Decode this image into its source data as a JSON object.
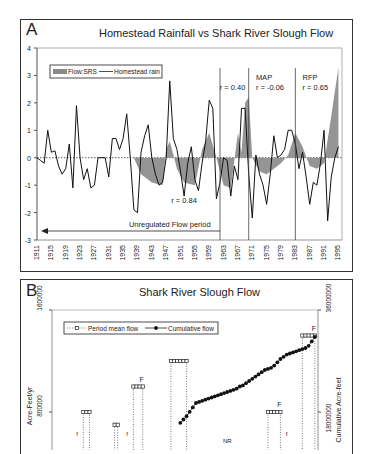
{
  "panelA": {
    "label": "A",
    "title": "Homestead Rainfall vs Shark River Slough Flow",
    "legend": {
      "flow": "Flow:SRS",
      "rain": "Homestead rain"
    },
    "annotations": {
      "r_unregulated": "r = 0.84",
      "r_period2": "r = 0.40",
      "map_label": "MAP",
      "r_map": "r = -0.06",
      "rfp_label": "RFP",
      "r_rfp": "r = 0.65",
      "unregulated": "Unregulated Flow period"
    }
  },
  "panelB": {
    "label": "B",
    "title": "Shark River Slough Flow",
    "legend": {
      "period": "Period mean flow",
      "cumulative": "Cumulative flow"
    },
    "y_left_label": "Acre-Feet/yr",
    "y_right_label": "Cumulative  Acre-feet",
    "y_left_ticks": [
      "1600000",
      "800000"
    ],
    "y_right_ticks": [
      "36000000",
      "18000000"
    ],
    "markers": [
      "F",
      "F",
      "F",
      "f",
      "f",
      "f",
      "NR"
    ]
  },
  "chart_data": [
    {
      "type": "line",
      "title": "Homestead Rainfall vs Shark River Slough Flow",
      "xlabel": "",
      "ylabel": "",
      "ylim": [
        -3,
        4
      ],
      "yticks": [
        -3,
        -2,
        -1,
        0,
        1,
        2,
        3,
        4
      ],
      "xticks": [
        "1911",
        "1915",
        "1919",
        "1923",
        "1927",
        "1931",
        "1935",
        "1939",
        "1943",
        "1947",
        "1951",
        "1955",
        "1959",
        "1963",
        "1967",
        "1971",
        "1975",
        "1979",
        "1983",
        "1987",
        "1991",
        "1995"
      ],
      "legend_position": "top-left",
      "series": [
        {
          "name": "Homestead rain",
          "style": "line",
          "x": [
            1911,
            1912,
            1913,
            1914,
            1915,
            1916,
            1917,
            1918,
            1919,
            1920,
            1921,
            1922,
            1923,
            1924,
            1925,
            1926,
            1927,
            1928,
            1929,
            1930,
            1931,
            1932,
            1933,
            1934,
            1935,
            1936,
            1937,
            1938,
            1939,
            1940,
            1941,
            1942,
            1943,
            1944,
            1945,
            1946,
            1947,
            1948,
            1949,
            1950,
            1951,
            1952,
            1953,
            1954,
            1955,
            1956,
            1957,
            1958,
            1959,
            1960,
            1961,
            1962,
            1963,
            1964,
            1965,
            1966,
            1967,
            1968,
            1969,
            1970,
            1971,
            1972,
            1973,
            1974,
            1975,
            1976,
            1977,
            1978,
            1979,
            1980,
            1981,
            1982,
            1983,
            1984,
            1985,
            1986,
            1987,
            1988,
            1989,
            1990,
            1991,
            1992,
            1993,
            1994,
            1995
          ],
          "values": [
            0,
            -0.1,
            -0.2,
            1.0,
            0.2,
            0.25,
            -0.3,
            -0.6,
            -0.4,
            0.5,
            -1.1,
            1.9,
            0.0,
            -0.8,
            -0.4,
            -1.1,
            -1.0,
            0.0,
            0.0,
            0.0,
            -0.7,
            0.7,
            0.7,
            0.3,
            0.7,
            1.6,
            0.0,
            -1.9,
            -2.0,
            0.2,
            0.8,
            1.2,
            0.0,
            -0.6,
            -1.0,
            -0.9,
            0.0,
            2.8,
            0.7,
            0.3,
            -0.5,
            -1.4,
            -0.2,
            0.4,
            -0.8,
            -1.2,
            -0.2,
            0.6,
            2.1,
            1.8,
            -1.5,
            -0.9,
            0.0,
            -0.1,
            -1.4,
            -0.3,
            -0.8,
            1.8,
            1.8,
            -0.6,
            -2.2,
            0.1,
            -0.6,
            -1.0,
            -1.7,
            -0.6,
            0.8,
            0.0,
            0.1,
            0.3,
            1.0,
            1.0,
            0.5,
            -0.4,
            0.2,
            -0.7,
            -1.7,
            -0.9,
            -1.0,
            -0.2,
            1.0,
            -2.3,
            -0.7,
            0.0,
            0.4
          ]
        },
        {
          "name": "Flow:SRS",
          "style": "area",
          "x": [
            1911,
            1935,
            1938,
            1940,
            1943,
            1946,
            1947,
            1948,
            1950,
            1952,
            1955,
            1957,
            1959,
            1961,
            1963,
            1965,
            1967,
            1968,
            1969,
            1970,
            1971,
            1973,
            1975,
            1977,
            1979,
            1981,
            1983,
            1985,
            1987,
            1989,
            1991,
            1993,
            1995
          ],
          "values": [
            0,
            0,
            0,
            -0.6,
            -0.9,
            -1.0,
            0.3,
            0.6,
            -0.4,
            -0.9,
            -1.0,
            0.3,
            0.9,
            0.0,
            -1.0,
            -1.1,
            0.9,
            0.2,
            2.0,
            2.2,
            0.0,
            -0.5,
            -0.6,
            -0.4,
            -0.2,
            0.1,
            0.9,
            0.4,
            -0.3,
            -0.4,
            -0.2,
            1.5,
            3.3
          ]
        }
      ],
      "vertical_lines": [
        1962,
        1970,
        1983
      ],
      "annotations": [
        "r = 0.84",
        "r = 0.40",
        "MAP r = -0.06",
        "RFP r = 0.65",
        "Unregulated Flow period (arrow 1911–1962)"
      ]
    },
    {
      "type": "line",
      "title": "Shark River Slough Flow",
      "ylabel": "Acre-Feet/yr",
      "ylabel_right": "Cumulative  Acre-feet",
      "ylim_left": [
        0,
        1600000
      ],
      "ylim_right": [
        0,
        36000000
      ],
      "yticks_left": [
        800000,
        1600000
      ],
      "yticks_right": [
        18000000,
        36000000
      ],
      "legend_position": "top-left",
      "series": [
        {
          "name": "Period mean flow",
          "style": "dotted-square-steps",
          "segments": [
            {
              "x": [
                1921,
                1922,
                1923
              ],
              "value": 800000
            },
            {
              "x": [
                1931,
                1932
              ],
              "value": 700000
            },
            {
              "x": [
                1937,
                1938,
                1939,
                1940
              ],
              "value": 1000000,
              "marker": "F"
            },
            {
              "x": [
                1949,
                1950,
                1951,
                1952,
                1953,
                1954
              ],
              "value": 1200000
            },
            {
              "x": [
                1980,
                1981,
                1982,
                1983,
                1984
              ],
              "value": 800000,
              "marker": "F"
            },
            {
              "x": [
                1991,
                1992,
                1993,
                1994,
                1995
              ],
              "value": 1400000,
              "marker": "F"
            }
          ]
        },
        {
          "name": "Cumulative flow",
          "style": "line-with-dots",
          "x": [
            1952,
            1953,
            1954,
            1955,
            1956,
            1957,
            1958,
            1959,
            1960,
            1961,
            1962,
            1963,
            1964,
            1965,
            1966,
            1967,
            1968,
            1969,
            1970,
            1971,
            1972,
            1973,
            1974,
            1975,
            1976,
            1977,
            1978,
            1979,
            1980,
            1981,
            1982,
            1983,
            1984,
            1985,
            1986,
            1987,
            1988,
            1989,
            1990,
            1991,
            1992,
            1993,
            1994,
            1995
          ],
          "values_pct_of_right_axis": [
            22,
            25,
            28,
            32,
            36,
            40,
            41,
            42,
            43,
            44,
            45,
            46,
            47,
            48,
            49,
            50,
            51,
            52,
            53,
            55,
            56,
            58,
            60,
            62,
            64,
            66,
            68,
            70,
            71,
            72,
            74,
            77,
            80,
            82,
            84,
            85,
            86,
            87,
            88,
            89,
            90,
            92,
            96,
            100
          ]
        }
      ],
      "annotations": [
        "F",
        "F",
        "F",
        "f",
        "f",
        "f",
        "NR"
      ]
    }
  ]
}
